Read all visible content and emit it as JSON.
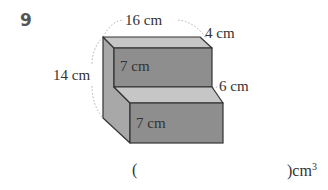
{
  "question": {
    "number": "9",
    "labels": {
      "top_length": "16 cm",
      "top_depth": "4 cm",
      "total_height": "14 cm",
      "upper_front_height": "7 cm",
      "step_depth": "6 cm",
      "lower_front_height": "7 cm"
    },
    "answer": {
      "open_paren": "(",
      "close_paren": ")",
      "unit": "cm",
      "unit_exponent": "3"
    }
  },
  "colors": {
    "front_face": "#8e8e8e",
    "top_face": "#c4c4c4",
    "side_face": "#a8a8a8",
    "edge": "#333333",
    "dotted_arc": "#aaaaaa"
  }
}
